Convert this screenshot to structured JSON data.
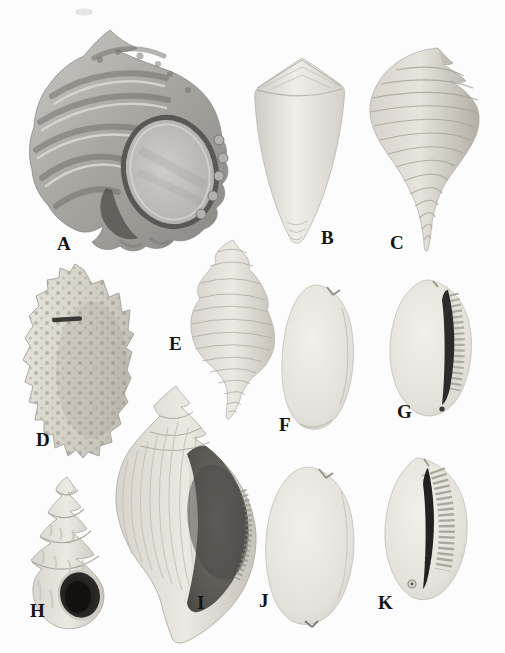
{
  "plate": {
    "background_color": "#fcfcfc",
    "label_color": "#151515",
    "specimens": [
      {
        "label": "A"
      },
      {
        "label": "B"
      },
      {
        "label": "C"
      },
      {
        "label": "D"
      },
      {
        "label": "E"
      },
      {
        "label": "F"
      },
      {
        "label": "G"
      },
      {
        "label": "H"
      },
      {
        "label": "I"
      },
      {
        "label": "J"
      },
      {
        "label": "K"
      }
    ]
  }
}
